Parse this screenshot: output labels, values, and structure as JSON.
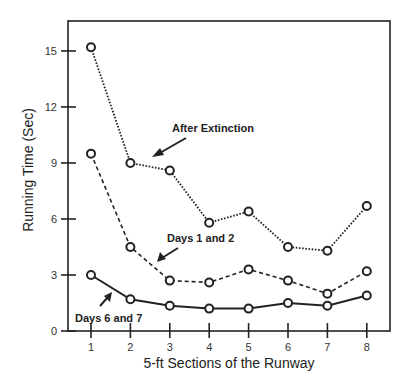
{
  "chart_data": {
    "type": "line",
    "title": "",
    "xlabel": "5-ft Sections of the Runway",
    "ylabel": "Running Time (Sec)",
    "x": [
      1,
      2,
      3,
      4,
      5,
      6,
      7,
      8
    ],
    "xticks": [
      "1",
      "2",
      "3",
      "4",
      "5",
      "6",
      "7",
      "8"
    ],
    "yticks": [
      "0",
      "3",
      "6",
      "9",
      "12",
      "15"
    ],
    "ylim": [
      0,
      16.5
    ],
    "xlim": [
      0.4,
      8.6
    ],
    "grid": false,
    "legend": "none (inline annotations with arrows)",
    "series": [
      {
        "name": "After Extinction",
        "style": "dotted",
        "values": [
          15.2,
          9.0,
          8.6,
          5.8,
          6.4,
          4.5,
          4.3,
          6.7
        ]
      },
      {
        "name": "Days 1 and 2",
        "style": "dashed",
        "values": [
          9.5,
          4.5,
          2.7,
          2.6,
          3.3,
          2.7,
          2.0,
          3.2
        ]
      },
      {
        "name": "Days 6 and 7",
        "style": "solid",
        "values": [
          3.0,
          1.7,
          1.35,
          1.2,
          1.2,
          1.5,
          1.35,
          1.9
        ]
      }
    ],
    "annotations": [
      {
        "text": "After Extinction",
        "target_series": "After Extinction"
      },
      {
        "text": "Days 1 and 2",
        "target_series": "Days 1 and 2"
      },
      {
        "text": "Days 6 and 7",
        "target_series": "Days 6 and 7"
      }
    ]
  }
}
